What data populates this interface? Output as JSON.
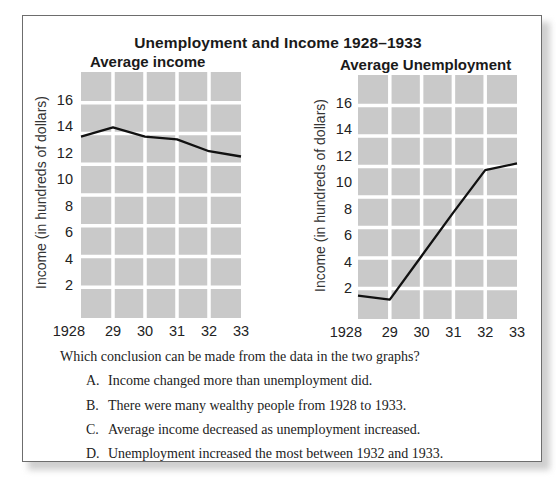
{
  "main_title": "Unemployment and Income 1928–1933",
  "chart_data": [
    {
      "type": "line",
      "title": "Average income",
      "xlabel": "",
      "ylabel": "Income (in hundreds of dollars)",
      "categories": [
        "1928",
        "29",
        "30",
        "31",
        "32",
        "33"
      ],
      "x": [
        1928,
        1929,
        1930,
        1931,
        1932,
        1933
      ],
      "values": [
        13.3,
        14.0,
        13.3,
        13.1,
        12.2,
        11.8
      ],
      "yticks": [
        2,
        4,
        6,
        8,
        10,
        12,
        14,
        16
      ],
      "ylim": [
        0,
        18
      ],
      "grid": true,
      "grid_color": "#ffffff",
      "plot_background": "#c9c9c9",
      "line_color": "#111111",
      "legend": null
    },
    {
      "type": "line",
      "title": "Average Unemployment",
      "xlabel": "",
      "ylabel": "Income (in hundreds of dollars)",
      "categories": [
        "1928",
        "29",
        "30",
        "31",
        "32",
        "33"
      ],
      "x": [
        1928,
        1929,
        1930,
        1931,
        1932,
        1933
      ],
      "values": [
        1.5,
        1.2,
        4.5,
        7.8,
        11.0,
        11.5
      ],
      "yticks": [
        2,
        4,
        6,
        8,
        10,
        12,
        14,
        16
      ],
      "ylim": [
        0,
        18
      ],
      "grid": true,
      "grid_color": "#ffffff",
      "plot_background": "#c9c9c9",
      "line_color": "#111111",
      "legend": null
    }
  ],
  "question": {
    "prompt": "Which conclusion can be made from the data in the two graphs?",
    "options": [
      {
        "letter": "A.",
        "text": "Income changed more than unemployment did."
      },
      {
        "letter": "B.",
        "text": "There were many wealthy people from 1928 to 1933."
      },
      {
        "letter": "C.",
        "text": "Average income decreased as unemployment increased."
      },
      {
        "letter": "D.",
        "text": "Unemployment increased the most between 1932 and 1933."
      }
    ]
  }
}
